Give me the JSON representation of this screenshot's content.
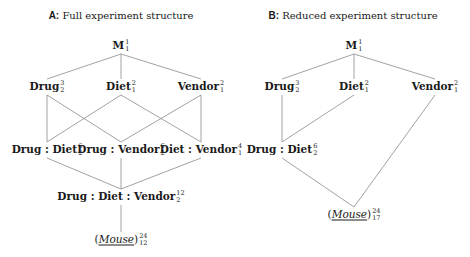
{
  "panels": [
    {
      "letter": "A:",
      "title": "Full experiment structure",
      "nodes": [
        {
          "id": "M",
          "label": "M",
          "sup": "1",
          "sub": "1"
        },
        {
          "id": "Drug",
          "label": "Drug",
          "sup": "3",
          "sub": "2"
        },
        {
          "id": "Diet",
          "label": "Diet",
          "sup": "2",
          "sub": "1"
        },
        {
          "id": "Vendor",
          "label": "Vendor",
          "sup": "2",
          "sub": "1"
        },
        {
          "id": "DrugDiet",
          "label": "Drug : Diet",
          "sup": "6",
          "sub": "2"
        },
        {
          "id": "DrugVendor",
          "label": "Drug : Vendor",
          "sup": "6",
          "sub": "2"
        },
        {
          "id": "DietVendor",
          "label": "Diet : Vendor",
          "sup": "4",
          "sub": "1"
        },
        {
          "id": "DrugDietVendor",
          "label": "Drug : Diet : Vendor",
          "sup": "12",
          "sub": "2"
        },
        {
          "id": "Mouse",
          "label": "Mouse",
          "sup": "24",
          "sub": "12",
          "random": true
        }
      ],
      "edges": [
        [
          "M",
          "Drug"
        ],
        [
          "M",
          "Diet"
        ],
        [
          "M",
          "Vendor"
        ],
        [
          "Drug",
          "DrugDiet"
        ],
        [
          "Drug",
          "DrugVendor"
        ],
        [
          "Diet",
          "DrugDiet"
        ],
        [
          "Diet",
          "DietVendor"
        ],
        [
          "Vendor",
          "DrugVendor"
        ],
        [
          "Vendor",
          "DietVendor"
        ],
        [
          "DrugDiet",
          "DrugDietVendor"
        ],
        [
          "DrugVendor",
          "DrugDietVendor"
        ],
        [
          "DietVendor",
          "DrugDietVendor"
        ],
        [
          "DrugDietVendor",
          "Mouse"
        ]
      ]
    },
    {
      "letter": "B:",
      "title": "Reduced experiment structure",
      "nodes": [
        {
          "id": "M",
          "label": "M",
          "sup": "1",
          "sub": "1"
        },
        {
          "id": "Drug",
          "label": "Drug",
          "sup": "3",
          "sub": "2"
        },
        {
          "id": "Diet",
          "label": "Diet",
          "sup": "2",
          "sub": "1"
        },
        {
          "id": "Vendor",
          "label": "Vendor",
          "sup": "2",
          "sub": "1"
        },
        {
          "id": "DrugDiet",
          "label": "Drug : Diet",
          "sup": "6",
          "sub": "2"
        },
        {
          "id": "Mouse",
          "label": "Mouse",
          "sup": "24",
          "sub": "17",
          "random": true
        }
      ],
      "edges": [
        [
          "M",
          "Drug"
        ],
        [
          "M",
          "Diet"
        ],
        [
          "M",
          "Vendor"
        ],
        [
          "Drug",
          "DrugDiet"
        ],
        [
          "Diet",
          "DrugDiet"
        ],
        [
          "Vendor",
          "Mouse"
        ],
        [
          "DrugDiet",
          "Mouse"
        ]
      ]
    }
  ]
}
